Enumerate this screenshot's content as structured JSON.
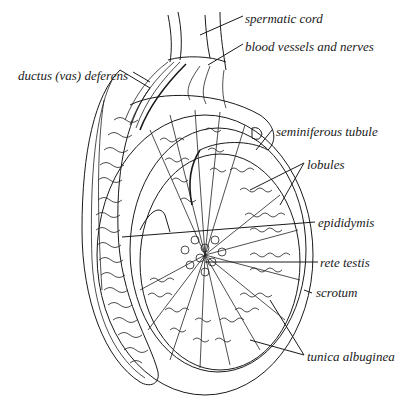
{
  "diagram": {
    "labels": [
      {
        "id": "spermatic-cord",
        "text": "spermatic cord",
        "x": 245,
        "y": 12
      },
      {
        "id": "blood-vessels-and-nerves",
        "text": "blood vessels and nerves",
        "x": 245,
        "y": 40
      },
      {
        "id": "ductus-vas-deferens",
        "text": "ductus (vas) deferens",
        "x": 18,
        "y": 69
      },
      {
        "id": "seminiferous-tubule",
        "text": "seminiferous tubule",
        "x": 276,
        "y": 125
      },
      {
        "id": "lobules",
        "text": "lobules",
        "x": 307,
        "y": 158
      },
      {
        "id": "epididymis",
        "text": "epididymis",
        "x": 318,
        "y": 216
      },
      {
        "id": "rete-testis",
        "text": "rete testis",
        "x": 320,
        "y": 256
      },
      {
        "id": "scrotum",
        "text": "scrotum",
        "x": 316,
        "y": 286
      },
      {
        "id": "tunica-albuginea",
        "text": "tunica albuginea",
        "x": 307,
        "y": 350
      }
    ],
    "colors": {
      "ink": "#1a1a1a",
      "background": "#ffffff"
    }
  }
}
